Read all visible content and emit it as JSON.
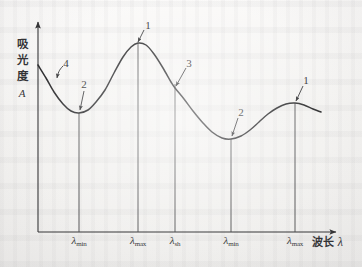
{
  "figure": {
    "axes": {
      "y_title": "吸光度",
      "y_symbol": "A",
      "x_title": "波长",
      "x_symbol": "λ"
    },
    "tick_labels": [
      {
        "id": "lambda-min-1",
        "base": "λ",
        "sub": "min",
        "x": 79
      },
      {
        "id": "lambda-max-1",
        "base": "λ",
        "sub": "max",
        "x": 138
      },
      {
        "id": "lambda-sh",
        "base": "λ",
        "sub": "sh",
        "x": 175
      },
      {
        "id": "lambda-min-2",
        "base": "λ",
        "sub": "min",
        "x": 231
      },
      {
        "id": "lambda-max-2",
        "base": "λ",
        "sub": "max",
        "x": 295
      }
    ],
    "callouts": [
      {
        "id": "callout-4",
        "label": "4",
        "x": 66,
        "y": 63
      },
      {
        "id": "callout-2-a",
        "label": "2",
        "x": 84,
        "y": 84
      },
      {
        "id": "callout-1-a",
        "label": "1",
        "x": 148,
        "y": 25
      },
      {
        "id": "callout-3",
        "label": "3",
        "x": 189,
        "y": 63
      },
      {
        "id": "callout-2-b",
        "label": "2",
        "x": 241,
        "y": 112
      },
      {
        "id": "callout-1-b",
        "label": "1",
        "x": 306,
        "y": 80
      }
    ]
  },
  "chart_data": {
    "type": "line",
    "title": "",
    "xlabel": "波长 λ",
    "ylabel": "吸光度 A",
    "grid": false,
    "legend": null,
    "axis_style": "arrow-ended, no numeric scale",
    "x_tick_labels": [
      "λmin",
      "λmax",
      "λsh",
      "λmin",
      "λmax"
    ],
    "x_tick_positions": [
      79,
      138,
      175,
      231,
      295
    ],
    "annotations": [
      {
        "label": "4",
        "feature": "end absorption / rising tail at short wavelength",
        "points_to_x": 57,
        "points_to_y": 78
      },
      {
        "label": "2",
        "feature": "absorption minimum (valley)",
        "points_to_x": 79,
        "points_to_y": 113
      },
      {
        "label": "1",
        "feature": "absorption maximum (peak)",
        "points_to_x": 138,
        "points_to_y": 43
      },
      {
        "label": "3",
        "feature": "shoulder (inflection)",
        "points_to_x": 175,
        "points_to_y": 88
      },
      {
        "label": "2",
        "feature": "absorption minimum (valley)",
        "points_to_x": 231,
        "points_to_y": 139
      },
      {
        "label": "1",
        "feature": "absorption maximum (peak)",
        "points_to_x": 295,
        "points_to_y": 103
      }
    ],
    "curve_points": [
      [
        38,
        65
      ],
      [
        46,
        78
      ],
      [
        54,
        92
      ],
      [
        63,
        104
      ],
      [
        71,
        111
      ],
      [
        79,
        113
      ],
      [
        88,
        110
      ],
      [
        96,
        102
      ],
      [
        105,
        90
      ],
      [
        114,
        73
      ],
      [
        123,
        57
      ],
      [
        131,
        47
      ],
      [
        138,
        43
      ],
      [
        146,
        45
      ],
      [
        154,
        54
      ],
      [
        163,
        68
      ],
      [
        171,
        82
      ],
      [
        175,
        88
      ],
      [
        184,
        99
      ],
      [
        193,
        111
      ],
      [
        203,
        123
      ],
      [
        212,
        132
      ],
      [
        222,
        138
      ],
      [
        231,
        139
      ],
      [
        241,
        136
      ],
      [
        250,
        130
      ],
      [
        259,
        122
      ],
      [
        268,
        114
      ],
      [
        277,
        108
      ],
      [
        286,
        104
      ],
      [
        295,
        103
      ],
      [
        304,
        105
      ],
      [
        313,
        109
      ],
      [
        321,
        112
      ]
    ]
  }
}
